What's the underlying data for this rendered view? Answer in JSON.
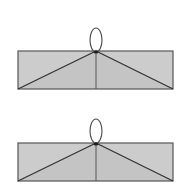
{
  "diagram": {
    "colors": {
      "background": "#ffffff",
      "fill": "#cccccc",
      "fill_lower": "#c4c4c4",
      "stroke": "#555555",
      "loop_stroke": "#555555",
      "diagonal_stroke": "#333333",
      "knot": "#222222"
    },
    "figures": [
      {
        "id": "figure-top",
        "rect": {
          "x": 18,
          "y": 51,
          "w": 155,
          "h": 38
        },
        "apex": {
          "x": 96,
          "y": 51
        },
        "loop": {
          "cx": 96,
          "cy": 40,
          "rx": 6,
          "ry": 12
        }
      },
      {
        "id": "figure-bottom",
        "rect": {
          "x": 18,
          "y": 143,
          "w": 155,
          "h": 38
        },
        "apex": {
          "x": 96,
          "y": 143
        },
        "loop": {
          "cx": 96,
          "cy": 131,
          "rx": 6,
          "ry": 12
        }
      }
    ]
  }
}
